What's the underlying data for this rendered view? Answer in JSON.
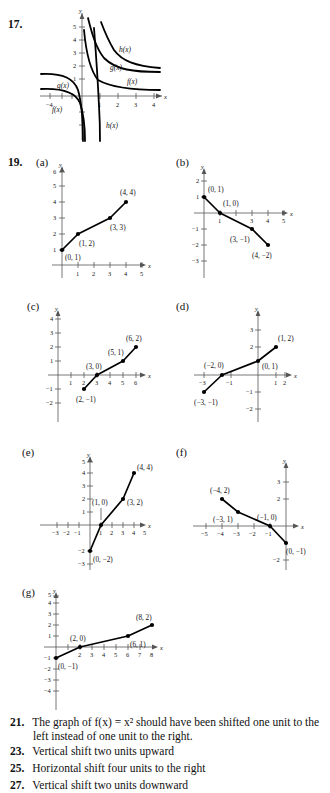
{
  "page": {
    "width": 330,
    "height": 793,
    "background": "#ffffff",
    "ink": "#111111",
    "axis_color": "#555555"
  },
  "exercise_17": {
    "number": "17.",
    "type": "rational-function-graphs",
    "description": "Graphs of f(x), g(x) and h(x): shifted reciprocal / rational curves",
    "axis": {
      "xlabel": "x",
      "ylabel": "y",
      "x_ticks": [
        "-4",
        "1",
        "2",
        "3",
        "4"
      ],
      "y_ticks": [
        "1",
        "2",
        "3",
        "4",
        "5"
      ],
      "xlim": [
        -4.6,
        4.6
      ],
      "ylim": [
        -3.2,
        5.9
      ]
    },
    "curve_labels": [
      {
        "text": "h(x)",
        "x": 2.3,
        "y": 3.05
      },
      {
        "text": "g(x)",
        "x": 1.9,
        "y": 2.15
      },
      {
        "text": "f(x)",
        "x": 2.55,
        "y": 1.2
      },
      {
        "text": "g(x)",
        "x": -2.6,
        "y": 0.95
      },
      {
        "text": "f(x)",
        "x": -3.3,
        "y": -0.55
      },
      {
        "text": "h(x)",
        "x": 0.95,
        "y": -1.95
      }
    ]
  },
  "exercise_19": {
    "number": "19.",
    "panels": [
      {
        "letter": "(a)",
        "axis": {
          "xlabel": "x",
          "ylabel": "y",
          "xlim": [
            -0.6,
            5.6
          ],
          "ylim": [
            -0.6,
            6.3
          ],
          "x_ticks": [
            "1",
            "2",
            "3",
            "4",
            "5"
          ],
          "y_ticks": [
            "1",
            "2",
            "3",
            "4",
            "5",
            "6"
          ]
        },
        "points": [
          {
            "x": 0,
            "y": 1,
            "label": "(0, 1)",
            "lx": 6,
            "ly": 13
          },
          {
            "x": 1,
            "y": 2,
            "label": "(1, 2)",
            "lx": 4,
            "ly": 13
          },
          {
            "x": 3,
            "y": 3,
            "label": "(3, 3)",
            "lx": 3,
            "ly": 13
          },
          {
            "x": 4,
            "y": 4,
            "label": "(4, 4)",
            "lx": 1,
            "ly": -6
          }
        ]
      },
      {
        "letter": "(b)",
        "axis": {
          "xlabel": "x",
          "ylabel": "y",
          "xlim": [
            -0.6,
            5.6
          ],
          "ylim": [
            -3.4,
            2.9
          ],
          "x_ticks": [
            "1",
            "3",
            "4",
            "5"
          ],
          "y_ticks": [
            "2",
            "1",
            "-1",
            "-2",
            "-3"
          ]
        },
        "points": [
          {
            "x": 0,
            "y": 1,
            "label": "(0, 1)",
            "lx": 4,
            "ly": -7
          },
          {
            "x": 1,
            "y": 0,
            "label": "(1, 0)",
            "lx": 4,
            "ly": -6
          },
          {
            "x": 3,
            "y": -1,
            "label": "(3, −1)",
            "lx": -22,
            "ly": 13
          },
          {
            "x": 4,
            "y": -2,
            "label": "(4, −2)",
            "lx": -12,
            "ly": 14
          }
        ]
      },
      {
        "letter": "(c)",
        "axis": {
          "xlabel": "x",
          "ylabel": "y",
          "xlim": [
            -0.6,
            6.8
          ],
          "ylim": [
            -2.6,
            4.8
          ],
          "x_ticks": [
            "1",
            "2",
            "3",
            "4",
            "5",
            "6"
          ],
          "y_ticks": [
            "1",
            "2",
            "3",
            "4",
            "-1",
            "-2"
          ]
        },
        "points": [
          {
            "x": 2,
            "y": -1,
            "label": "(2, −1)",
            "lx": -8,
            "ly": 14
          },
          {
            "x": 3,
            "y": 0,
            "label": "(3, 0)",
            "lx": -8,
            "ly": -6
          },
          {
            "x": 5,
            "y": 1,
            "label": "(5, 1)",
            "lx": -8,
            "ly": -7
          },
          {
            "x": 6,
            "y": 2,
            "label": "(6, 2)",
            "lx": -6,
            "ly": -7
          }
        ]
      },
      {
        "letter": "(d)",
        "axis": {
          "xlabel": "x",
          "ylabel": "y",
          "xlim": [
            -3.6,
            2.7
          ],
          "ylim": [
            -2.6,
            3.8
          ],
          "x_ticks": [
            "-3",
            "-1",
            "1",
            "2"
          ],
          "y_ticks": [
            "2",
            "3",
            "-1",
            "-2"
          ]
        },
        "points": [
          {
            "x": -3,
            "y": -1,
            "label": "(−3, −1)",
            "lx": -10,
            "ly": 14
          },
          {
            "x": -2,
            "y": 0,
            "label": "(−2, 0)",
            "lx": -12,
            "ly": -7
          },
          {
            "x": 0,
            "y": 1,
            "label": "(0, 1)",
            "lx": 5,
            "ly": 8
          },
          {
            "x": 1,
            "y": 2,
            "label": "(1, 2)",
            "lx": 4,
            "ly": -7
          }
        ]
      },
      {
        "letter": "(e)",
        "axis": {
          "xlabel": "x",
          "ylabel": "y",
          "xlim": [
            -3.6,
            5.6
          ],
          "ylim": [
            -3.4,
            5.9
          ],
          "x_ticks": [
            "-3",
            "-2",
            "-1",
            "1",
            "2",
            "3",
            "4",
            "5"
          ],
          "y_ticks": [
            "1",
            "2",
            "3",
            "4",
            "5",
            "-2",
            "-3"
          ]
        },
        "points": [
          {
            "x": 0,
            "y": -2,
            "label": "(0, −2)",
            "lx": 4,
            "ly": 12
          },
          {
            "x": 1,
            "y": 0,
            "label": "(1, 0)",
            "lx": -4,
            "ly": -16
          },
          {
            "x": 3,
            "y": 2,
            "label": "(3, 2)",
            "lx": 5,
            "ly": 5
          },
          {
            "x": 4,
            "y": 4,
            "label": "(4, 4)",
            "lx": 5,
            "ly": -4
          }
        ]
      },
      {
        "letter": "(f)",
        "axis": {
          "xlabel": "x",
          "ylabel": "y",
          "xlim": [
            -5.6,
            1.4
          ],
          "ylim": [
            -2.6,
            3.8
          ],
          "x_ticks": [
            "-5",
            "-4",
            "-3",
            "-2",
            "-1"
          ],
          "y_ticks": [
            "2",
            "3",
            "-2"
          ]
        },
        "points": [
          {
            "x": -4,
            "y": 2,
            "label": "(−4, 2)",
            "lx": -12,
            "ly": -8
          },
          {
            "x": -3,
            "y": 1,
            "label": "(−3, 1)",
            "lx": -26,
            "ly": 12
          },
          {
            "x": -1,
            "y": 0,
            "label": "(−1, 0)",
            "lx": -10,
            "ly": -8
          },
          {
            "x": 0,
            "y": -1,
            "label": "(0, −1)",
            "lx": 3,
            "ly": 12
          }
        ]
      },
      {
        "letter": "(g)",
        "axis": {
          "xlabel": "x",
          "ylabel": "y",
          "xlim": [
            -0.8,
            8.8
          ],
          "ylim": [
            -4.4,
            5.9
          ],
          "x_ticks": [
            "2",
            "3",
            "4",
            "5",
            "6",
            "7",
            "8"
          ],
          "y_ticks": [
            "1",
            "2",
            "3",
            "4",
            "5",
            "-1",
            "-2",
            "-3",
            "-4"
          ]
        },
        "points": [
          {
            "x": 0,
            "y": -1,
            "label": "(0, −1)",
            "lx": 3,
            "ly": 14
          },
          {
            "x": 2,
            "y": 0,
            "label": "(2, 0)",
            "lx": -10,
            "ly": -7
          },
          {
            "x": 6,
            "y": 1,
            "label": "(6, 1)",
            "lx": -4,
            "ly": 13
          },
          {
            "x": 8,
            "y": 2,
            "label": "(8, 2)",
            "lx": -8,
            "ly": -7
          }
        ]
      }
    ]
  },
  "answers": [
    {
      "number": "21.",
      "lines": [
        "The graph of f(x) = x² should have been shifted one unit to the",
        "left instead of one unit to the right."
      ]
    },
    {
      "number": "23.",
      "lines": [
        "Vertical shift two units upward"
      ]
    },
    {
      "number": "25.",
      "lines": [
        "Horizontal shift four units to the right"
      ]
    },
    {
      "number": "27.",
      "lines": [
        "Vertical shift two units downward"
      ]
    }
  ]
}
